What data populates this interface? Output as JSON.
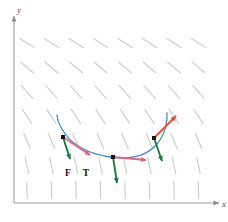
{
  "figure": {
    "type": "vector-field-with-curve",
    "background_color": "#ffffff",
    "width": 228,
    "height": 222
  },
  "axes": {
    "color": "#9a9a9a",
    "x_axis": {
      "label": "x",
      "origin": [
        14,
        203
      ],
      "end": [
        219,
        203
      ]
    },
    "y_axis": {
      "label": "y",
      "origin": [
        14,
        203
      ],
      "end": [
        14,
        16
      ]
    }
  },
  "vector_field": {
    "color": "#c9cdd2",
    "segment_length": 17,
    "rows": 7,
    "cols": 8,
    "x_start": 27,
    "x_step": 24.5,
    "y_start": 43,
    "y_step": 24.5,
    "angles_deg": [
      -32,
      -40,
      -48,
      -57,
      -67,
      -78,
      -88
    ],
    "description": "grid of short line segments rotating from shallow down-right at top to near-vertical at bottom"
  },
  "curve": {
    "name": "trajectory",
    "color": "#4a90c4",
    "stroke_width": 1.3,
    "path": "M 57 115 C 57 115, 60 150, 110 157 C 160 164, 168 128, 167 113"
  },
  "points": [
    {
      "id": "point-left",
      "cx": 63,
      "cy": 137,
      "size": 4,
      "color": "#111111",
      "force_vector": {
        "color": "#1f7a3f",
        "dx": 7,
        "dy": 22,
        "label": "F"
      },
      "tangent_vector": {
        "color": "#e8607e",
        "dx": 27,
        "dy": 18,
        "label": "T"
      }
    },
    {
      "id": "point-middle",
      "cx": 113,
      "cy": 157,
      "size": 4,
      "color": "#111111",
      "force_vector": {
        "color": "#1f7a3f",
        "dx": 4,
        "dy": 26,
        "label": "F"
      },
      "tangent_vector": {
        "color": "#e8607e",
        "dx": 33,
        "dy": 3,
        "label": "T"
      }
    },
    {
      "id": "point-right",
      "cx": 154,
      "cy": 138,
      "size": 4,
      "color": "#111111",
      "force_vector": {
        "color": "#1f7a3f",
        "dx": 8,
        "dy": 23,
        "label": "F"
      },
      "tangent_vector": {
        "color": "#e8503a",
        "dx": 22,
        "dy": -22,
        "label": "T"
      }
    }
  ],
  "labels": {
    "force_label": "F",
    "tangent_label": "T",
    "force_label_pos": [
      68,
      176
    ],
    "tangent_label_pos": [
      86,
      176
    ]
  }
}
